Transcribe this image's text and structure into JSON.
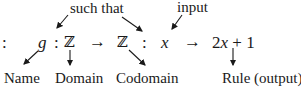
{
  "annotations": {
    "such_that": "such that",
    "input": "input"
  },
  "expression": {
    "leading_colon": ":",
    "name": "g",
    "colon1": ":",
    "domain": "ℤ",
    "arrow1": "→",
    "codomain": "ℤ",
    "colon2": ":",
    "variable": "x",
    "arrow2": "→",
    "rule": "2x + 1"
  },
  "labels": {
    "name": "Name",
    "domain": "Domain",
    "codomain": "Codomain",
    "rule": "Rule (output)"
  },
  "colors": {
    "text": "#1a1a1a",
    "background": "#ffffff"
  }
}
